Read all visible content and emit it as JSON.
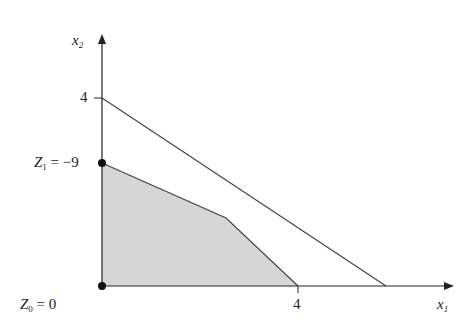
{
  "diagram": {
    "axes": {
      "x_label": "x",
      "x_sub": "1",
      "y_label": "x",
      "y_sub": "2"
    },
    "ticks": {
      "x_tick": "4",
      "y_tick": "4"
    },
    "points": [
      {
        "name": "Z",
        "sub": "1",
        "value": "= −9",
        "coords": [
          0,
          2.6
        ]
      },
      {
        "name": "Z",
        "sub": "0",
        "value": "= 0",
        "coords": [
          0,
          0
        ]
      }
    ],
    "lines": [
      {
        "from": [
          0,
          4
        ],
        "to": [
          5.8,
          0
        ]
      },
      {
        "from": [
          0,
          2.6
        ],
        "to": [
          4,
          0
        ],
        "via": [
          2.5,
          1.4
        ]
      }
    ],
    "feasible_region": {
      "fill": "#d6d6d6",
      "vertices": [
        [
          0,
          0
        ],
        [
          0,
          2.6
        ],
        [
          2.5,
          1.4
        ],
        [
          4,
          0
        ]
      ]
    },
    "colors": {
      "line": "#444444",
      "axis": "#222222",
      "fill": "#d6d6d6",
      "point": "#111111"
    }
  }
}
